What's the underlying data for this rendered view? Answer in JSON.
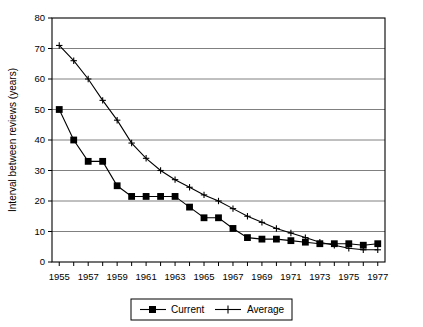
{
  "chart_data": {
    "type": "line",
    "title": "",
    "subtitle": "",
    "xlabel": "",
    "ylabel": "Interval between reviews (years)",
    "xlim": [
      1954.5,
      1977.5
    ],
    "ylim": [
      0,
      80
    ],
    "ytick_step": 10,
    "yticks": [
      0,
      10,
      20,
      30,
      40,
      50,
      60,
      70,
      80
    ],
    "ytick_labels": [
      "0",
      "10",
      "20",
      "30",
      "40",
      "50",
      "60",
      "70",
      "80"
    ],
    "xticks": [
      1955,
      1956,
      1957,
      1958,
      1959,
      1960,
      1961,
      1962,
      1963,
      1964,
      1965,
      1966,
      1967,
      1968,
      1969,
      1970,
      1971,
      1972,
      1973,
      1974,
      1975,
      1976,
      1977
    ],
    "xtick_labels_shown": [
      "1955",
      "1957",
      "1959",
      "1961",
      "1963",
      "1965",
      "1967",
      "1969",
      "1971",
      "1973",
      "1975",
      "1977"
    ],
    "xtick_label_years": [
      1955,
      1957,
      1959,
      1961,
      1963,
      1965,
      1967,
      1969,
      1971,
      1973,
      1975,
      1977
    ],
    "grid": "horizontal",
    "legend_position": "bottom",
    "x": [
      1955,
      1956,
      1957,
      1958,
      1959,
      1960,
      1961,
      1962,
      1963,
      1964,
      1965,
      1966,
      1967,
      1968,
      1969,
      1970,
      1971,
      1972,
      1973,
      1974,
      1975,
      1976,
      1977
    ],
    "series": [
      {
        "name": "Current",
        "marker": "filled-square",
        "color": "#000000",
        "values": [
          50,
          40,
          33,
          33,
          25,
          21.5,
          21.5,
          21.5,
          21.5,
          18,
          14.5,
          14.5,
          11,
          8,
          7.5,
          7.5,
          7,
          6.5,
          6,
          6,
          6,
          5.5,
          6
        ]
      },
      {
        "name": "Average",
        "marker": "plus",
        "color": "#000000",
        "values": [
          71,
          66,
          60,
          53,
          46.5,
          39,
          34,
          30,
          27,
          24.5,
          22,
          20,
          17.5,
          15,
          13,
          11,
          9.5,
          8,
          6.5,
          5.5,
          4.5,
          4,
          4
        ]
      }
    ]
  },
  "axes": {
    "ylabel": "Interval between reviews (years)"
  },
  "legend": {
    "items": [
      {
        "label": "Current",
        "marker": "filled-square"
      },
      {
        "label": "Average",
        "marker": "plus"
      }
    ]
  }
}
